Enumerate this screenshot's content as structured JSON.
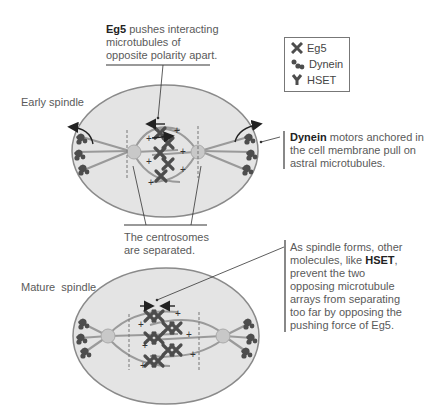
{
  "annotations": {
    "eg5": {
      "bold": "Eg5",
      "lines": [
        " pushes interacting",
        "microtubules of",
        "opposite polarity apart."
      ]
    },
    "dynein": {
      "bold": "Dynein",
      "lines": [
        " motors anchored in",
        "the cell membrane pull on",
        "astral microtubules."
      ]
    },
    "centrosomes": {
      "lines": [
        "The centrosomes",
        "are separated."
      ]
    },
    "hset": {
      "line1": "As spindle forms, other",
      "line2_pre": "molecules, like ",
      "bold": "HSET",
      "line2_post": ",",
      "rest": [
        "prevent the two",
        "opposing microtubule",
        "arrays from separating",
        "too far by opposing the",
        "pushing force of Eg5."
      ]
    }
  },
  "labels": {
    "early": "Early spindle",
    "mature": "Mature  spindle"
  },
  "legend": [
    {
      "icon": "eg5-motor-icon",
      "label": "Eg5"
    },
    {
      "icon": "dynein-motor-icon",
      "label": "Dynein"
    },
    {
      "icon": "hset-motor-icon",
      "label": "HSET"
    }
  ],
  "colors": {
    "cell_fill": "#e4e4e4",
    "cell_stroke": "#8a8a8a",
    "motor": "#4d4d4d",
    "microtubule": "#9a9a9a",
    "centrosome": "#c8c8c8"
  },
  "plus_sign": "+"
}
